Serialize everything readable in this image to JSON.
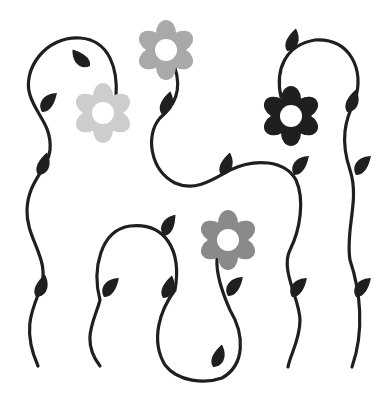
{
  "illustration": {
    "title": "Floral vine pattern",
    "background": "#ffffff",
    "vine_color": "#1f1f1f",
    "flowers": [
      {
        "name": "flower-light-gray",
        "color": "#cdcdcd",
        "cx": 103,
        "cy": 113
      },
      {
        "name": "flower-mid-gray",
        "color": "#a9a9a9",
        "cx": 166,
        "cy": 50
      },
      {
        "name": "flower-black",
        "color": "#1f1f1f",
        "cx": 291,
        "cy": 116
      },
      {
        "name": "flower-dark-gray",
        "color": "#8a8a8a",
        "cx": 228,
        "cy": 240
      }
    ]
  }
}
